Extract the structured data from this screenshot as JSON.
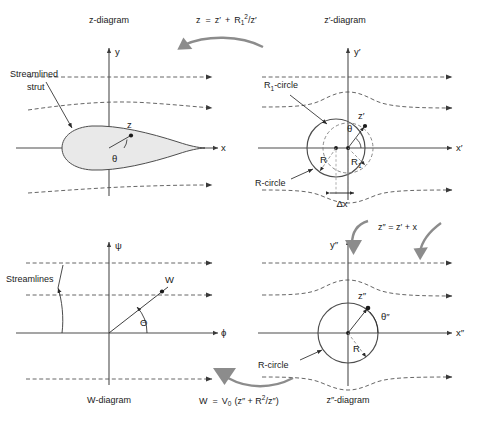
{
  "figure": {
    "panels": {
      "z": {
        "caption": "z-diagram",
        "axis_x": "x",
        "axis_y": "y",
        "annotation_body": "Streamlined\nstrut",
        "annotation_body_line1": "Streamlined",
        "annotation_body_line2": "strut",
        "point_label": "z",
        "angle_label": "θ"
      },
      "zprime": {
        "caption": "z′-diagram",
        "axis_x": "x′",
        "axis_y": "y′",
        "circle_inner_label": "R₁-circle",
        "circle_outer_label": "R-circle",
        "radius_outer": "R",
        "radius_inner": "R₁",
        "offset_label": "Δx",
        "point_label": "z′",
        "angle_label": "θ"
      },
      "w": {
        "caption": "W-diagram",
        "axis_x": "ϕ",
        "axis_y": "ψ",
        "annotation_streamlines": "Streamlines",
        "point_label": "W",
        "angle_label": "Θ"
      },
      "zdprime": {
        "caption": "z″-diagram",
        "axis_x": "x″",
        "axis_y": "y″",
        "circle_label": "R-circle",
        "radius_label": "R",
        "point_label": "z″",
        "angle_label": "θ″"
      }
    },
    "equations": {
      "top": {
        "lhs": "z",
        "eq": "=",
        "rhs_a": "z′",
        "plus": "+",
        "rhs_base": "R",
        "rhs_sub": "1",
        "rhs_sup": "2",
        "rhs_den": "/z′",
        "full": "z = z′ + R₁²/z′"
      },
      "right": {
        "full": "z″ = z′ + x",
        "lhs": "z″",
        "eq": "=",
        "rhs": "z′ + x"
      },
      "bottom": {
        "full": "W = V₀ (z″ + R²/z″)",
        "lhs": "W",
        "eq": "=",
        "v": "V",
        "v_sub": "0",
        "open": "(z″ + ",
        "r": "R",
        "r_sup": "2",
        "close": "/z″)"
      }
    },
    "colors": {
      "arrow_gray": "#8c8c8c",
      "body_fill": "#e9e9e9",
      "line": "#4d4d4d",
      "text": "#1a1a1a",
      "dash": "#555555"
    }
  }
}
